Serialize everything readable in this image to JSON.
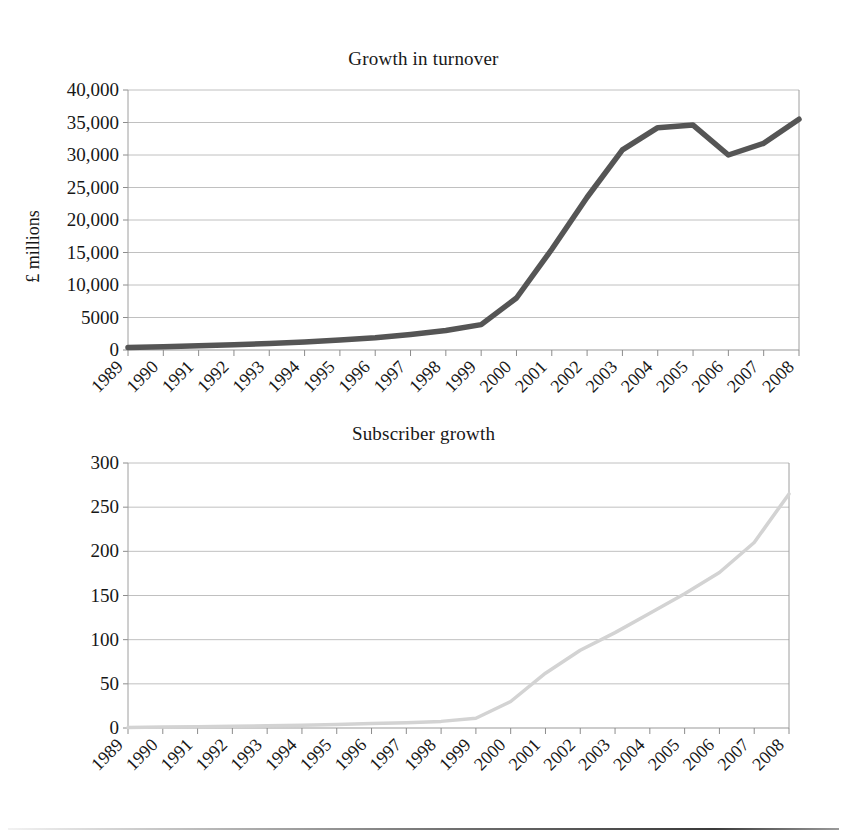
{
  "page": {
    "background": "#ffffff",
    "bottom_rule_color": "#3a3a3a"
  },
  "figures": [
    {
      "name": "growth-in-turnover",
      "title": "Growth in turnover",
      "ylabel": "£ millions"
    },
    {
      "name": "subscriber-growth",
      "title": "Subscriber growth",
      "ylabel": "Millions"
    }
  ],
  "chart_data": [
    {
      "type": "line",
      "title": "Growth in turnover",
      "xlabel": "",
      "ylabel": "£ millions",
      "series_color": "#555555",
      "grid": true,
      "legend": "none",
      "ylim": [
        0,
        40000
      ],
      "yticks": [
        0,
        5000,
        10000,
        15000,
        20000,
        25000,
        30000,
        35000,
        40000
      ],
      "ytick_labels": [
        "0",
        "5000",
        "10,000",
        "15,000",
        "20,000",
        "25,000",
        "30,000",
        "35,000",
        "40,000"
      ],
      "categories": [
        "1989",
        "1990",
        "1991",
        "1992",
        "1993",
        "1994",
        "1995",
        "1996",
        "1997",
        "1998",
        "1999",
        "2000",
        "2001",
        "2002",
        "2003",
        "2004",
        "2005",
        "2006",
        "2007",
        "2008"
      ],
      "values": [
        400,
        500,
        650,
        800,
        1000,
        1250,
        1550,
        1900,
        2400,
        3000,
        3900,
        8000,
        15500,
        23500,
        30800,
        34200,
        34600,
        30000,
        31800,
        35500
      ]
    },
    {
      "type": "line",
      "title": "Subscriber growth",
      "xlabel": "",
      "ylabel": "Millions",
      "series_color": "#d3d3d3",
      "grid": true,
      "legend": "none",
      "ylim": [
        0,
        300
      ],
      "yticks": [
        0,
        50,
        100,
        150,
        200,
        250,
        300
      ],
      "ytick_labels": [
        "0",
        "50",
        "100",
        "150",
        "200",
        "250",
        "300"
      ],
      "categories": [
        "1989",
        "1990",
        "1991",
        "1992",
        "1993",
        "1994",
        "1995",
        "1996",
        "1997",
        "1998",
        "1999",
        "2000",
        "2001",
        "2002",
        "2003",
        "2004",
        "2005",
        "2006",
        "2007",
        "2008"
      ],
      "values": [
        0.5,
        1,
        1.5,
        2,
        2.5,
        3,
        4,
        5,
        6,
        7.5,
        11,
        30,
        62,
        88,
        108,
        130,
        152,
        176,
        210,
        265
      ]
    }
  ]
}
